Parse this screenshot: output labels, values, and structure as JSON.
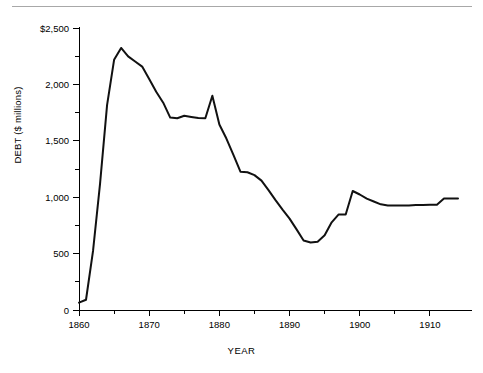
{
  "figure": {
    "top_rule": "horizontal-rule",
    "footnote": ""
  },
  "chart_data": {
    "type": "line",
    "title": "",
    "xlabel": "YEAR",
    "ylabel": "DEBT ($ millions)",
    "xlim": [
      1860,
      1914
    ],
    "ylim": [
      0,
      2500
    ],
    "grid": false,
    "legend": null,
    "x_ticks": [
      "1860",
      "1870",
      "1880",
      "1890",
      "1900",
      "1910"
    ],
    "x_tick_values": [
      1860,
      1870,
      1880,
      1890,
      1900,
      1910
    ],
    "x_minor_interval": 5,
    "y_ticks": [
      "0",
      "500",
      "1,000",
      "1,500",
      "2,000",
      "$2,500"
    ],
    "y_tick_values": [
      0,
      500,
      1000,
      1500,
      2000,
      2500
    ],
    "y_minor_interval": 250,
    "line_color": "#111111",
    "series": [
      {
        "name": "Federal debt",
        "x": [
          1860,
          1861,
          1862,
          1863,
          1864,
          1865,
          1866,
          1867,
          1868,
          1869,
          1870,
          1871,
          1872,
          1873,
          1874,
          1875,
          1876,
          1877,
          1878,
          1879,
          1880,
          1881,
          1882,
          1883,
          1884,
          1885,
          1886,
          1887,
          1888,
          1889,
          1890,
          1891,
          1892,
          1893,
          1894,
          1895,
          1896,
          1897,
          1898,
          1899,
          1900,
          1901,
          1902,
          1903,
          1904,
          1905,
          1906,
          1907,
          1908,
          1909,
          1910,
          1911,
          1912,
          1913,
          1914
        ],
        "values": [
          65,
          91,
          524,
          1120,
          1816,
          2218,
          2323,
          2248,
          2203,
          2158,
          2047,
          1935,
          1838,
          1706,
          1700,
          1722,
          1712,
          1703,
          1700,
          1900,
          1645,
          1520,
          1375,
          1226,
          1221,
          1196,
          1147,
          1063,
          974,
          890,
          810,
          715,
          616,
          598,
          606,
          662,
          777,
          847,
          847,
          1055,
          1024,
          987,
          962,
          937,
          926,
          926,
          926,
          926,
          930,
          931,
          932,
          934,
          988,
          988,
          988
        ]
      }
    ]
  }
}
